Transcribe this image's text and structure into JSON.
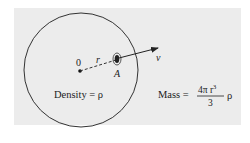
{
  "diagram": {
    "center_label": "0",
    "radius_label": "r",
    "point_label": "A",
    "velocity_label": "v",
    "density_label": "Density = ρ",
    "mass_label_prefix": "Mass =",
    "mass_numerator": "4π r",
    "mass_numerator_exp": "3",
    "mass_denominator": "3",
    "mass_suffix": "ρ",
    "colors": {
      "background": "#ececec",
      "stroke": "#333333",
      "text": "#222222"
    }
  }
}
